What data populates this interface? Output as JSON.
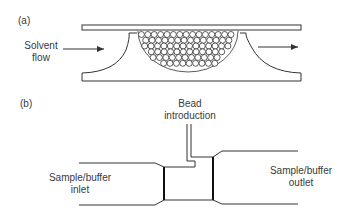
{
  "panel_a": {
    "label": "(a)",
    "inlet_label_line1": "Solvent",
    "inlet_label_line2": "flow",
    "bead_rows": 6
  },
  "panel_b": {
    "label": "(b)",
    "top_label_line1": "Bead",
    "top_label_line2": "introduction",
    "left_label_line1": "Sample/buffer",
    "left_label_line2": "inlet",
    "right_label_line1": "Sample/buffer",
    "right_label_line2": "outlet"
  },
  "colors": {
    "line": "#333333",
    "background": "#ffffff"
  }
}
